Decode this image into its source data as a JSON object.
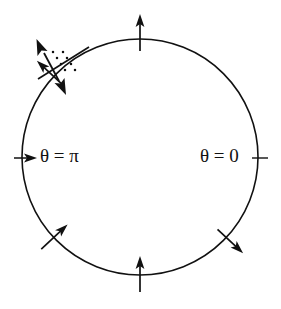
{
  "figure": {
    "background_color": "#ffffff",
    "line_color": "#111111",
    "width": 281,
    "height": 309
  },
  "circle": {
    "name": "phase-circle",
    "center_x": 140,
    "center_y": 157,
    "radius": 118,
    "stroke_width": 1.6
  },
  "labels": {
    "theta_zero": "θ = 0",
    "theta_pi": "θ = π"
  },
  "label_positions": {
    "theta_zero_x": 200,
    "theta_zero_y": 158,
    "theta_pi_x": 36,
    "theta_pi_y": 158
  },
  "arrows": [
    {
      "name": "arrow-top",
      "angle_deg": 90,
      "direction": "outward",
      "length": 22,
      "description": "radial arrow pointing up at top of circle"
    },
    {
      "name": "arrow-upper-right",
      "angle_deg": 47,
      "direction": "outward",
      "length": 22,
      "description": "radial arrow pointing up-right"
    },
    {
      "name": "arrow-lower-right",
      "angle_deg": -47,
      "direction": "inward",
      "length": 22,
      "description": "radial arrow pointing up-left toward center"
    },
    {
      "name": "arrow-bottom",
      "angle_deg": -90,
      "direction": "inward",
      "length": 22,
      "description": "radial arrow pointing up toward center"
    },
    {
      "name": "arrow-lower-left",
      "angle_deg": -133,
      "direction": "inward",
      "length": 22,
      "description": "radial arrow pointing up-right toward center"
    }
  ],
  "ticks": [
    {
      "name": "tick-theta-zero",
      "angle_deg": 0,
      "description": "short radial tick mark at theta = 0"
    },
    {
      "name": "tick-theta-pi",
      "angle_deg": 180,
      "description": "short arrow pointing right at theta = pi"
    }
  ],
  "double_arrow": {
    "name": "double-headed-arrow",
    "angle_deg": 133,
    "description": "double-headed arrow straddling circle in upper-left quadrant",
    "head_outer_x": 38,
    "head_outer_y": 46,
    "head_inner_x": 62,
    "head_inner_y": 88
  },
  "crossing_line": {
    "name": "crossing-line",
    "description": "plain line crossing the double-headed arrow",
    "x1": 40,
    "y1": 78,
    "x2": 88,
    "y2": 48
  },
  "dot_marks": {
    "name": "dotted-hash-marks",
    "count": 8,
    "description": "small dots forming two short dotted strokes near the crossing"
  }
}
